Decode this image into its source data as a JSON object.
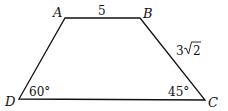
{
  "figure": {
    "type": "trapezoid",
    "vertices": {
      "A": {
        "label": "A",
        "x": 65,
        "y": 18
      },
      "B": {
        "label": "B",
        "x": 140,
        "y": 18
      },
      "C": {
        "label": "C",
        "x": 205,
        "y": 100
      },
      "D": {
        "label": "D",
        "x": 19,
        "y": 99
      }
    },
    "sides": {
      "AB": "5",
      "BC_coef": "3",
      "BC_rad": "2"
    },
    "angles": {
      "D": "60°",
      "C": "45°"
    },
    "stroke_color": "#111111"
  }
}
